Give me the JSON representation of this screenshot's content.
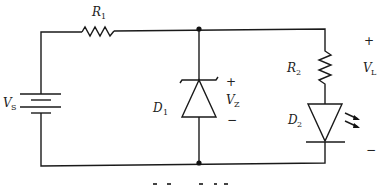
{
  "circuit": {
    "components": [
      {
        "id": "R1",
        "type": "resistor",
        "label": "R",
        "subscript": "1"
      },
      {
        "id": "R2",
        "type": "resistor",
        "label": "R",
        "subscript": "2"
      },
      {
        "id": "VS",
        "type": "battery",
        "label": "V",
        "subscript": "S"
      },
      {
        "id": "D1",
        "type": "zener-diode",
        "label": "D",
        "subscript": "1"
      },
      {
        "id": "D2",
        "type": "led",
        "label": "D",
        "subscript": "2"
      }
    ],
    "voltages": {
      "VZ": {
        "label": "V",
        "subscript": "Z",
        "plus": "+",
        "minus": "−"
      },
      "VL": {
        "label": "V",
        "subscript": "L",
        "plus": "+",
        "minus": "−"
      }
    }
  }
}
